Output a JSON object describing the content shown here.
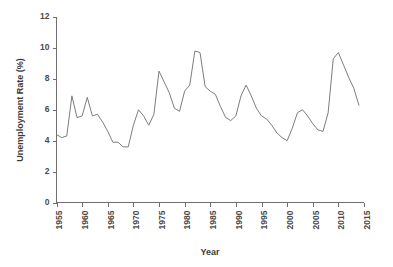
{
  "chart_data": {
    "type": "line",
    "title": "",
    "xlabel": "Year",
    "ylabel": "Unemployment Rate (%)",
    "xlim": [
      1955,
      2015
    ],
    "ylim": [
      0,
      12
    ],
    "xticks": [
      1955,
      1960,
      1965,
      1970,
      1975,
      1980,
      1985,
      1990,
      1995,
      2000,
      2005,
      2010,
      2015
    ],
    "yticks": [
      0,
      2,
      4,
      6,
      8,
      10,
      12
    ],
    "xtick_labels": [
      "1955",
      "1960",
      "1965",
      "1970",
      "1975",
      "1980",
      "1985",
      "1990",
      "1995",
      "2000",
      "2005",
      "2010",
      "2015"
    ],
    "ytick_labels": [
      "0",
      "2",
      "4",
      "6",
      "8",
      "10",
      "12"
    ],
    "grid": false,
    "legend": false,
    "line_color": "#7d7d7d",
    "series": [
      {
        "name": "Unemployment Rate",
        "x": [
          1955,
          1956,
          1957,
          1958,
          1959,
          1960,
          1961,
          1962,
          1963,
          1964,
          1965,
          1966,
          1967,
          1968,
          1969,
          1970,
          1971,
          1972,
          1973,
          1974,
          1975,
          1976,
          1977,
          1978,
          1979,
          1980,
          1981,
          1982,
          1983,
          1984,
          1985,
          1986,
          1987,
          1988,
          1989,
          1990,
          1991,
          1992,
          1993,
          1994,
          1995,
          1996,
          1997,
          1998,
          1999,
          2000,
          2001,
          2002,
          2003,
          2004,
          2005,
          2006,
          2007,
          2008,
          2009,
          2010,
          2011,
          2012,
          2013,
          2014
        ],
        "values": [
          4.4,
          4.2,
          4.3,
          6.9,
          5.5,
          5.6,
          6.8,
          5.6,
          5.7,
          5.2,
          4.6,
          3.9,
          3.9,
          3.6,
          3.6,
          5.0,
          6.0,
          5.6,
          5.0,
          5.7,
          8.5,
          7.8,
          7.1,
          6.1,
          5.9,
          7.2,
          7.6,
          9.8,
          9.7,
          7.5,
          7.2,
          7.0,
          6.2,
          5.5,
          5.3,
          5.6,
          6.9,
          7.6,
          6.9,
          6.1,
          5.6,
          5.4,
          5.0,
          4.5,
          4.2,
          4.0,
          4.8,
          5.8,
          6.0,
          5.6,
          5.1,
          4.7,
          4.6,
          5.8,
          9.3,
          9.7,
          8.9,
          8.1,
          7.4,
          6.3
        ]
      }
    ]
  }
}
